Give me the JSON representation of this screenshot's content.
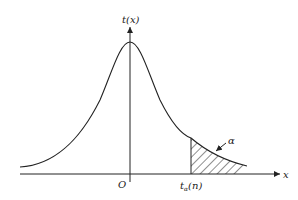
{
  "diagram": {
    "type": "t-distribution density with upper tail area",
    "y_axis_label": "t(x)",
    "x_axis_label": "x",
    "origin_label": "O",
    "critical_value_label": {
      "main": "t",
      "subscript": "α",
      "suffix": "(n)"
    },
    "tail_area_label": "α",
    "colors": {
      "stroke": "#222222",
      "background": "#ffffff"
    }
  }
}
